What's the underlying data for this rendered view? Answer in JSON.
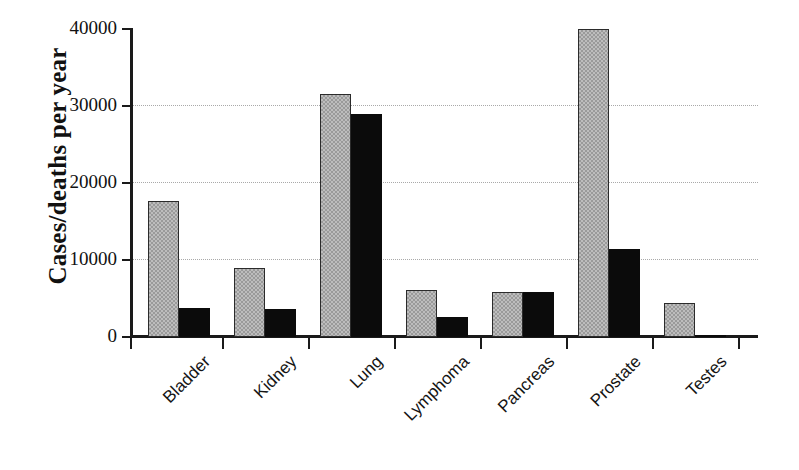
{
  "chart_data": {
    "type": "bar",
    "title": "",
    "xlabel": "",
    "ylabel": "Cases/deaths per year",
    "ylim": [
      0,
      40000
    ],
    "yticks": [
      0,
      10000,
      20000,
      30000,
      40000
    ],
    "ytick_labels": [
      "0",
      "10000",
      "20000",
      "30000",
      "40000"
    ],
    "grid": true,
    "grid_axis": "y",
    "legend": "none",
    "categories": [
      "Bladder",
      "Kidney",
      "Lung",
      "Lymphoma",
      "Pancreas",
      "Prostate",
      "Testes"
    ],
    "series": [
      {
        "name": "Cases",
        "color": "#bdbdbd",
        "pattern": "checkerboard",
        "values": [
          17700,
          8900,
          31500,
          6100,
          5800,
          40000,
          4400
        ]
      },
      {
        "name": "Deaths",
        "color": "#0b0b0b",
        "pattern": "solid",
        "values": [
          3800,
          3700,
          29000,
          2600,
          5800,
          11400,
          300
        ]
      }
    ]
  },
  "axis": {
    "y_title": "Cases/deaths per year"
  }
}
